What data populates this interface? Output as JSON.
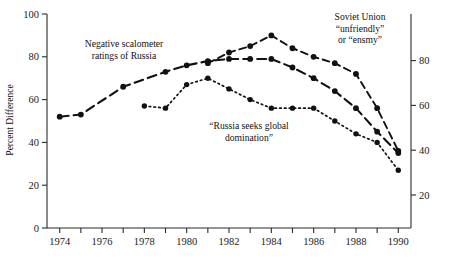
{
  "figure": {
    "y_axis_title": "Percent Difference",
    "background": "#ffffff",
    "ink_color": "#111111"
  },
  "annotations": [
    {
      "name": "negative-scalometer-annotation",
      "lines": [
        "Negative scalometer",
        "ratings of Russia"
      ],
      "x": 124,
      "y": 47,
      "anchor": "middle"
    },
    {
      "name": "russia-seeks-global-domination-annotation",
      "lines": [
        "“Russia seeks global",
        "domination”"
      ],
      "x": 249,
      "y": 129,
      "anchor": "middle"
    },
    {
      "name": "soviet-union-unfriendly-annotation",
      "lines": [
        "Soviet Union",
        "“unfriendly”",
        "or “ensmy”"
      ],
      "x": 360,
      "y": 20,
      "anchor": "middle"
    }
  ],
  "chart_data": {
    "type": "line",
    "title": "",
    "xlabel": "",
    "ylabel": "Percent Difference",
    "xlim": [
      1973.4,
      1990.6
    ],
    "ylim": [
      0,
      100
    ],
    "left_axis": {
      "ticks": [
        0,
        20,
        40,
        60,
        80,
        100
      ],
      "labels": [
        "0",
        "20",
        "40",
        "60",
        "80",
        "100"
      ],
      "range": [
        0,
        100
      ]
    },
    "right_axis": {
      "ticks": [
        20,
        40,
        60,
        80
      ],
      "labels": [
        "20",
        "40",
        "60",
        "80"
      ],
      "range": [
        0,
        100
      ],
      "offset_note": "right scale shifted relative to left scale"
    },
    "x_ticks": [
      1974,
      1975,
      1976,
      1977,
      1978,
      1979,
      1980,
      1981,
      1982,
      1983,
      1984,
      1985,
      1986,
      1987,
      1988,
      1989,
      1990
    ],
    "x_tick_labels": [
      "1974",
      "",
      "1976",
      "",
      "1978",
      "",
      "1980",
      "",
      "1982",
      "",
      "1984",
      "",
      "1986",
      "",
      "1988",
      "",
      "1990"
    ],
    "grid": false,
    "legend": "none (inline annotations)",
    "series": [
      {
        "name": "Negative scalometer ratings of Russia",
        "style": "long-dash",
        "marker": "filled-circle",
        "x": [
          1974,
          1975,
          1977,
          1979,
          1980,
          1981,
          1982,
          1983,
          1984,
          1985,
          1986,
          1987,
          1988,
          1989,
          1990
        ],
        "values": [
          52,
          53,
          66,
          73,
          76,
          78,
          79,
          79,
          79,
          75,
          70,
          64,
          56,
          45,
          35
        ]
      },
      {
        "name": "Soviet Union “unfriendly” or “enemy”",
        "style": "dash",
        "marker": "filled-circle",
        "x": [
          1981,
          1982,
          1983,
          1984,
          1985,
          1986,
          1987,
          1988,
          1989,
          1990
        ],
        "values": [
          77,
          82,
          85,
          90,
          84,
          80,
          77,
          72,
          56,
          36
        ]
      },
      {
        "name": "“Russia seeks global domination”",
        "style": "dotted",
        "marker": "filled-circle",
        "x": [
          1978,
          1979,
          1980,
          1981,
          1982,
          1983,
          1984,
          1985,
          1986,
          1987,
          1988,
          1989,
          1990
        ],
        "values": [
          57,
          56,
          67,
          70,
          65,
          60,
          56,
          56,
          56,
          50,
          44,
          40,
          27
        ]
      }
    ]
  }
}
